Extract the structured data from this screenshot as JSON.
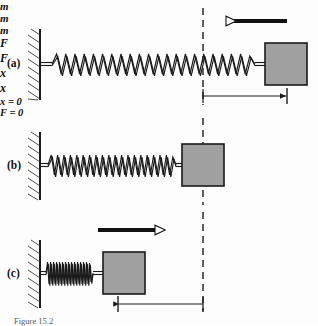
{
  "figure": {
    "caption": "Figure 15.2",
    "background_color": "#fdfdfd",
    "stroke_color": "#1a1a1a",
    "block_fill_color": "#a0a0a0",
    "block_stroke_color": "#1a1a1a",
    "arrow_fill_color": "#ffffff",
    "dashed_line_color": "#2b2b2b"
  },
  "panels": [
    {
      "id": "a",
      "label": "(a)",
      "state": "stretched",
      "mass_label": "m",
      "force_label": "F",
      "force_direction": "left",
      "displacement_label": "x",
      "spring_coils": 22,
      "description": "Spring stretched, block displaced right of equilibrium, applied force points left"
    },
    {
      "id": "b",
      "label": "(b)",
      "state": "equilibrium",
      "mass_label": "m",
      "position_label": "x = 0",
      "force_label": "F = 0",
      "spring_coils": 20,
      "description": "Spring at natural length, block at equilibrium, no applied force"
    },
    {
      "id": "c",
      "label": "(c)",
      "state": "compressed",
      "mass_label": "m",
      "force_label": "F",
      "force_direction": "right",
      "displacement_label": "x",
      "spring_coils": 16,
      "description": "Spring compressed, block displaced left of equilibrium, applied force points right"
    }
  ],
  "annotations": {
    "equilibrium_line": "dashed vertical reference line at x = 0",
    "wall": "fixed hatched wall support"
  }
}
